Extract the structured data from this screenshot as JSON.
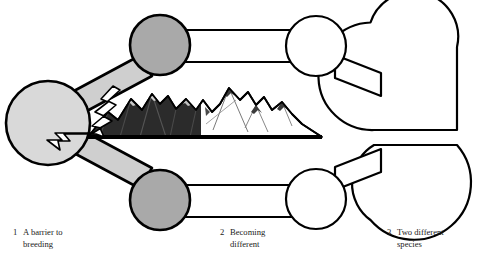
{
  "figure": {
    "background_color": "#ffffff",
    "outline_color": "#000000",
    "colors": {
      "population_light_gray": "#d9d9d9",
      "population_mid_gray": "#a9a9a9",
      "population_white": "#ffffff",
      "mountain_dark": "#2b2b2b",
      "mountain_light": "#ffffff",
      "outline": "#000000",
      "baseline": "#000000",
      "text": "#1a1a1a"
    }
  },
  "captions": [
    {
      "number": "1",
      "line1": "A barrier to",
      "line2": "breeding"
    },
    {
      "number": "2",
      "line1": "Becoming",
      "line2": "different"
    },
    {
      "number": "3",
      "line1": "Two different",
      "line2": "species"
    }
  ],
  "stages": {
    "stage1": {
      "label": "A barrier to breeding",
      "populations": [
        {
          "name": "ancestral-population",
          "fill": "#d9d9d9",
          "cx": 48,
          "cy": 124,
          "r": 42
        },
        {
          "name": "upper-split-population",
          "fill": "#a9a9a9",
          "cx": 160,
          "cy": 45,
          "r": 30
        },
        {
          "name": "lower-split-population",
          "fill": "#a9a9a9",
          "cx": 160,
          "cy": 200,
          "r": 30
        }
      ]
    },
    "stage2": {
      "label": "Becoming different",
      "populations": [
        {
          "name": "upper-diverging-population",
          "fill": "#ffffff",
          "cx": 316,
          "cy": 45,
          "r": 30
        },
        {
          "name": "lower-diverging-population",
          "fill": "#ffffff",
          "cx": 316,
          "cy": 200,
          "r": 30
        }
      ]
    },
    "stage3": {
      "label": "Two different species",
      "populations": [
        {
          "name": "upper-new-species",
          "fill": "#ffffff",
          "cx": 412,
          "cy": 47,
          "r": 45
        },
        {
          "name": "lower-new-species",
          "fill": "#ffffff",
          "cx": 412,
          "cy": 198,
          "r": 45
        }
      ]
    }
  },
  "barrier": {
    "name": "mountain-range-barrier",
    "description": "Mountain range dividing the ancestral population",
    "dark_half_fill": "#2b2b2b",
    "light_half_fill": "#ffffff",
    "division_x": 201,
    "baseline_y": 137,
    "left_x": 88,
    "right_x": 322
  },
  "arrow": {
    "name": "jagged-barrier-arrow",
    "description": "White zigzag arrow pointing from the barrier back into the ancestral population",
    "fill": "#ffffff"
  }
}
